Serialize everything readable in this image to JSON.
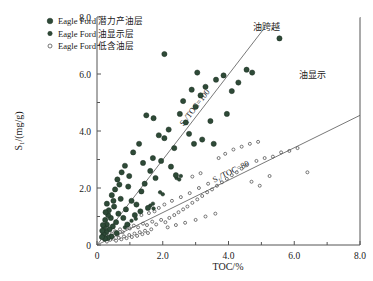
{
  "chart_data": {
    "type": "scatter",
    "title": "",
    "xlabel": "TOC/%",
    "ylabel": "S₁/(mg/g)",
    "xlim": [
      0,
      8.0
    ],
    "ylim": [
      0,
      8.0
    ],
    "xticks": [
      "0",
      "2.0",
      "4.0",
      "6.0",
      "8.0"
    ],
    "xtick_values": [
      0,
      2.0,
      4.0,
      6.0,
      8.0
    ],
    "yticks": [
      "0",
      "2.0",
      "4.0",
      "6.0",
      "8.0"
    ],
    "ytick_values": [
      0,
      2.0,
      4.0,
      6.0,
      8.0
    ],
    "grid": false,
    "legend_position": "top-left",
    "series": [
      {
        "name": "Eagle Ford 潜力产油层",
        "marker": "filled-circle",
        "color": "#2e4a37",
        "size": 5.2,
        "points": [
          [
            1.05,
            1.55
          ],
          [
            1.2,
            1.42
          ],
          [
            1.35,
            1.88
          ],
          [
            1.45,
            2.15
          ],
          [
            1.55,
            1.3
          ],
          [
            1.62,
            2.6
          ],
          [
            1.7,
            3.05
          ],
          [
            1.78,
            2.35
          ],
          [
            0.95,
            2.05
          ],
          [
            0.88,
            1.25
          ],
          [
            0.8,
            0.95
          ],
          [
            0.72,
            1.62
          ],
          [
            0.65,
            1.1
          ],
          [
            0.58,
            0.8
          ],
          [
            0.52,
            1.35
          ],
          [
            0.48,
            0.65
          ],
          [
            0.42,
            0.95
          ],
          [
            0.38,
            0.55
          ],
          [
            0.34,
            1.05
          ],
          [
            0.3,
            0.72
          ],
          [
            0.28,
            0.45
          ],
          [
            0.25,
            0.88
          ],
          [
            0.22,
            0.6
          ],
          [
            0.2,
            0.38
          ],
          [
            0.18,
            0.7
          ],
          [
            0.16,
            0.5
          ],
          [
            0.3,
            1.45
          ],
          [
            0.45,
            1.75
          ],
          [
            0.55,
            1.95
          ],
          [
            0.62,
            2.3
          ],
          [
            0.75,
            2.55
          ],
          [
            0.85,
            2.78
          ],
          [
            1.1,
            3.25
          ],
          [
            1.28,
            3.55
          ],
          [
            1.95,
            2.95
          ],
          [
            2.05,
            3.75
          ],
          [
            2.18,
            4.05
          ],
          [
            2.35,
            3.4
          ],
          [
            2.52,
            4.6
          ],
          [
            2.62,
            5.05
          ],
          [
            2.7,
            4.3
          ],
          [
            2.88,
            5.45
          ],
          [
            3.0,
            4.85
          ],
          [
            3.15,
            5.25
          ],
          [
            3.3,
            5.55
          ],
          [
            3.45,
            4.35
          ],
          [
            3.62,
            5.8
          ],
          [
            3.85,
            5.95
          ],
          [
            4.1,
            5.4
          ],
          [
            4.3,
            5.7
          ],
          [
            4.55,
            6.15
          ],
          [
            5.55,
            7.25
          ],
          [
            1.88,
            3.85
          ],
          [
            2.25,
            2.75
          ],
          [
            1.4,
            2.88
          ],
          [
            0.98,
            2.42
          ],
          [
            0.68,
            2.12
          ],
          [
            0.5,
            1.55
          ],
          [
            0.36,
            1.22
          ],
          [
            0.26,
            1.15
          ],
          [
            2.95,
            3.55
          ],
          [
            3.2,
            3.7
          ],
          [
            3.55,
            3.55
          ],
          [
            2.4,
            2.45
          ],
          [
            1.15,
            1.05
          ],
          [
            1.32,
            1.18
          ],
          [
            0.92,
            0.72
          ],
          [
            0.6,
            0.42
          ],
          [
            0.44,
            0.3
          ],
          [
            0.33,
            0.25
          ],
          [
            0.24,
            0.22
          ],
          [
            0.15,
            0.28
          ],
          [
            2.8,
            3.9
          ],
          [
            4.72,
            6.05
          ],
          [
            3.05,
            6.05
          ],
          [
            2.05,
            6.7
          ],
          [
            3.95,
            4.6
          ],
          [
            1.5,
            4.55
          ],
          [
            1.72,
            4.45
          ]
        ]
      },
      {
        "name": "Eagle Ford 油显示层",
        "marker": "filled-circle-small",
        "color": "#2e4a37",
        "size": 3.6,
        "points": [
          [
            1.05,
            0.85
          ],
          [
            1.18,
            0.92
          ],
          [
            0.95,
            0.72
          ],
          [
            0.85,
            0.62
          ],
          [
            1.62,
            1.38
          ],
          [
            1.7,
            1.45
          ],
          [
            1.72,
            1.28
          ],
          [
            2.42,
            2.35
          ],
          [
            2.5,
            2.3
          ],
          [
            2.55,
            2.42
          ],
          [
            1.92,
            1.85
          ],
          [
            2.0,
            1.78
          ]
        ]
      },
      {
        "name": "Eagle Ford 低含油层",
        "marker": "open-circle",
        "color": "#555555",
        "size": 3.0,
        "points": [
          [
            0.4,
            0.18
          ],
          [
            0.5,
            0.22
          ],
          [
            0.58,
            0.15
          ],
          [
            0.66,
            0.25
          ],
          [
            0.74,
            0.2
          ],
          [
            0.82,
            0.3
          ],
          [
            0.9,
            0.24
          ],
          [
            0.98,
            0.35
          ],
          [
            1.06,
            0.28
          ],
          [
            1.14,
            0.4
          ],
          [
            1.22,
            0.32
          ],
          [
            1.3,
            0.45
          ],
          [
            1.38,
            0.38
          ],
          [
            1.46,
            0.5
          ],
          [
            1.55,
            0.42
          ],
          [
            1.65,
            0.55
          ],
          [
            0.3,
            0.12
          ],
          [
            0.35,
            0.3
          ],
          [
            0.45,
            0.4
          ],
          [
            0.55,
            0.48
          ],
          [
            0.62,
            0.35
          ],
          [
            0.7,
            0.55
          ],
          [
            0.78,
            0.45
          ],
          [
            0.88,
            0.6
          ],
          [
            1.0,
            0.58
          ],
          [
            1.12,
            0.68
          ],
          [
            1.25,
            0.62
          ],
          [
            1.4,
            0.75
          ],
          [
            1.52,
            0.7
          ],
          [
            1.68,
            0.82
          ],
          [
            1.8,
            0.72
          ],
          [
            1.95,
            0.88
          ],
          [
            2.08,
            0.8
          ],
          [
            2.2,
            0.95
          ],
          [
            2.35,
            1.05
          ],
          [
            2.48,
            1.15
          ],
          [
            2.62,
            1.25
          ],
          [
            2.75,
            1.35
          ],
          [
            2.9,
            1.48
          ],
          [
            3.05,
            1.6
          ],
          [
            3.2,
            1.72
          ],
          [
            3.35,
            1.85
          ],
          [
            3.5,
            1.95
          ],
          [
            3.65,
            2.08
          ],
          [
            3.8,
            2.2
          ],
          [
            3.95,
            2.32
          ],
          [
            4.1,
            2.45
          ],
          [
            4.25,
            2.55
          ],
          [
            4.4,
            2.68
          ],
          [
            4.55,
            2.8
          ],
          [
            2.05,
            1.42
          ],
          [
            2.28,
            1.55
          ],
          [
            2.55,
            1.68
          ],
          [
            2.82,
            1.82
          ],
          [
            3.1,
            2.0
          ],
          [
            3.38,
            2.15
          ],
          [
            1.75,
            1.18
          ],
          [
            1.88,
            1.3
          ],
          [
            2.15,
            0.62
          ],
          [
            2.4,
            0.7
          ],
          [
            2.68,
            0.78
          ],
          [
            3.0,
            0.88
          ],
          [
            3.3,
            1.0
          ],
          [
            3.6,
            1.1
          ],
          [
            4.85,
            2.95
          ],
          [
            5.1,
            3.05
          ],
          [
            5.35,
            3.1
          ],
          [
            5.6,
            3.25
          ],
          [
            5.85,
            3.3
          ],
          [
            6.1,
            3.4
          ],
          [
            6.4,
            2.55
          ],
          [
            5.25,
            2.42
          ],
          [
            4.7,
            2.22
          ],
          [
            4.95,
            2.08
          ],
          [
            3.9,
            3.2
          ],
          [
            4.15,
            3.35
          ],
          [
            4.4,
            3.45
          ],
          [
            4.65,
            3.55
          ],
          [
            3.7,
            3.05
          ],
          [
            4.9,
            3.62
          ],
          [
            1.35,
            1.05
          ],
          [
            1.58,
            1.12
          ],
          [
            2.9,
            2.4
          ],
          [
            3.15,
            2.52
          ]
        ]
      }
    ],
    "reference_lines": [
      {
        "label": "S₁/TOC=100",
        "slope_ratio": "100",
        "from": [
          0.0,
          0.0
        ],
        "to": [
          5.05,
          7.55
        ],
        "color": "#555555"
      },
      {
        "label": "S₁/TOC=80",
        "slope_ratio": "80",
        "from": [
          0.0,
          0.0
        ],
        "to": [
          8.0,
          4.55
        ],
        "color": "#555555"
      }
    ],
    "annotations": [
      {
        "text": "油跨越",
        "x": 5.15,
        "y": 7.55
      },
      {
        "text": "油显示",
        "x": 6.55,
        "y": 5.85
      }
    ]
  },
  "legend": {
    "items": [
      {
        "label": "Eagle Ford 潜力产油层",
        "marker": "filled-circle"
      },
      {
        "label": "Eagle Ford 油显示层",
        "marker": "filled-circle-small"
      },
      {
        "label": "Eagle Ford 低含油层",
        "marker": "open-circle"
      }
    ]
  },
  "colors": {
    "marker_dark_green": "#2e4a37",
    "open_marker": "#555555",
    "axis": "#555555",
    "background": "#ffffff"
  }
}
